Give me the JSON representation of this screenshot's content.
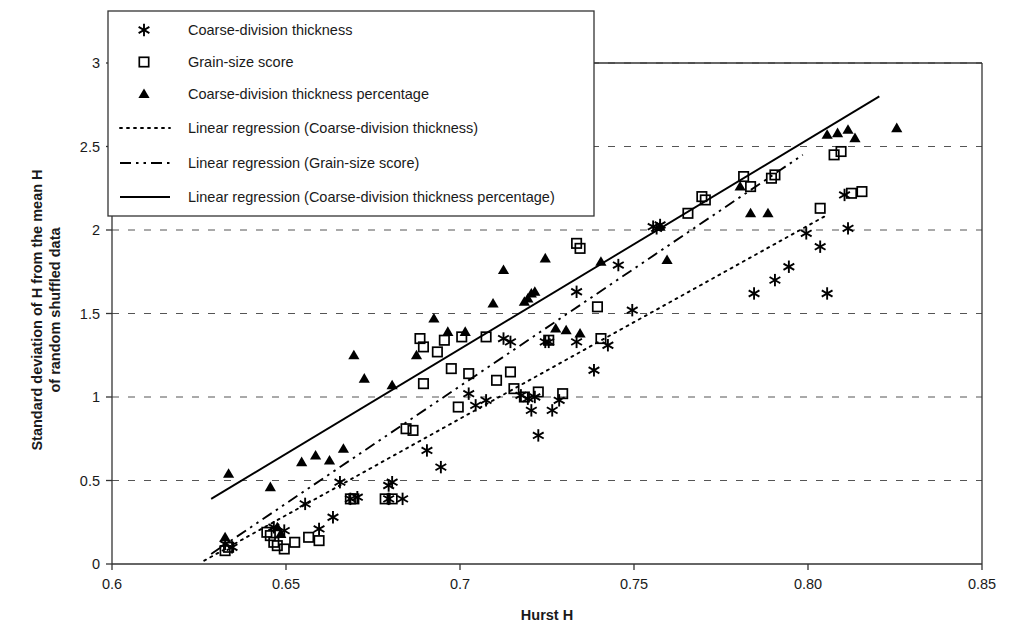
{
  "chart_data": {
    "type": "scatter",
    "title": "",
    "xlabel": "Hurst H",
    "ylabel_line1": "Standard deviation of H from the mean H",
    "ylabel_line2": "of random shuffled data",
    "xlim": [
      0.6,
      0.85
    ],
    "ylim": [
      0,
      3
    ],
    "xticks": [
      0.6,
      0.65,
      0.7,
      0.75,
      0.8,
      0.85
    ],
    "xtick_labels": [
      "0.6",
      "0.65",
      "0.7",
      "0.75",
      "0.80",
      "0.85"
    ],
    "yticks": [
      0,
      0.5,
      1,
      1.5,
      2,
      2.5,
      3
    ],
    "ytick_labels": [
      "0",
      "0.5",
      "1",
      "1.5",
      "2",
      "2.5",
      "3"
    ],
    "grid": "horizontal-dashed",
    "legend_position": "top-left-inside",
    "marker_color": "#000000",
    "series": [
      {
        "name": "Coarse-division thickness",
        "marker": "asterisk",
        "points": [
          [
            0.6325,
            0.12
          ],
          [
            0.6345,
            0.1
          ],
          [
            0.6465,
            0.22
          ],
          [
            0.6495,
            0.2
          ],
          [
            0.6555,
            0.36
          ],
          [
            0.6595,
            0.21
          ],
          [
            0.6635,
            0.28
          ],
          [
            0.6655,
            0.49
          ],
          [
            0.6685,
            0.39
          ],
          [
            0.6705,
            0.4
          ],
          [
            0.6795,
            0.47
          ],
          [
            0.6805,
            0.49
          ],
          [
            0.6795,
            0.39
          ],
          [
            0.6835,
            0.39
          ],
          [
            0.6905,
            0.68
          ],
          [
            0.6945,
            0.58
          ],
          [
            0.7025,
            1.02
          ],
          [
            0.7045,
            0.95
          ],
          [
            0.7075,
            0.98
          ],
          [
            0.7125,
            1.35
          ],
          [
            0.7145,
            1.33
          ],
          [
            0.7175,
            1.01
          ],
          [
            0.7195,
            0.99
          ],
          [
            0.7205,
            0.92
          ],
          [
            0.7215,
            1.0
          ],
          [
            0.7225,
            0.77
          ],
          [
            0.7245,
            1.33
          ],
          [
            0.7255,
            1.33
          ],
          [
            0.7265,
            0.92
          ],
          [
            0.7285,
            0.98
          ],
          [
            0.7335,
            1.63
          ],
          [
            0.7335,
            1.33
          ],
          [
            0.7385,
            1.16
          ],
          [
            0.7425,
            1.31
          ],
          [
            0.7455,
            1.79
          ],
          [
            0.7495,
            1.52
          ],
          [
            0.7555,
            2.02
          ],
          [
            0.7565,
            2.01
          ],
          [
            0.7575,
            2.03
          ],
          [
            0.7845,
            1.62
          ],
          [
            0.7905,
            1.7
          ],
          [
            0.7945,
            1.78
          ],
          [
            0.7995,
            1.98
          ],
          [
            0.8035,
            1.9
          ],
          [
            0.8055,
            1.62
          ],
          [
            0.8105,
            2.21
          ],
          [
            0.8115,
            2.01
          ]
        ]
      },
      {
        "name": "Grain-size score",
        "marker": "square",
        "points": [
          [
            0.6325,
            0.08
          ],
          [
            0.6335,
            0.1
          ],
          [
            0.6445,
            0.19
          ],
          [
            0.6455,
            0.17
          ],
          [
            0.6465,
            0.13
          ],
          [
            0.6475,
            0.11
          ],
          [
            0.6495,
            0.09
          ],
          [
            0.6525,
            0.13
          ],
          [
            0.6565,
            0.16
          ],
          [
            0.6595,
            0.14
          ],
          [
            0.6685,
            0.39
          ],
          [
            0.6695,
            0.39
          ],
          [
            0.6785,
            0.39
          ],
          [
            0.6805,
            0.39
          ],
          [
            0.6845,
            0.81
          ],
          [
            0.6865,
            0.8
          ],
          [
            0.6885,
            1.35
          ],
          [
            0.6895,
            1.3
          ],
          [
            0.6895,
            1.08
          ],
          [
            0.6935,
            1.27
          ],
          [
            0.6955,
            1.34
          ],
          [
            0.6975,
            1.17
          ],
          [
            0.6995,
            0.94
          ],
          [
            0.7005,
            1.36
          ],
          [
            0.7025,
            1.14
          ],
          [
            0.7075,
            1.36
          ],
          [
            0.7105,
            1.1
          ],
          [
            0.7145,
            1.15
          ],
          [
            0.7155,
            1.05
          ],
          [
            0.7185,
            1.0
          ],
          [
            0.7225,
            1.03
          ],
          [
            0.7255,
            1.34
          ],
          [
            0.7295,
            1.02
          ],
          [
            0.7335,
            1.92
          ],
          [
            0.7345,
            1.89
          ],
          [
            0.7395,
            1.54
          ],
          [
            0.7405,
            1.35
          ],
          [
            0.7655,
            2.1
          ],
          [
            0.7695,
            2.2
          ],
          [
            0.7705,
            2.18
          ],
          [
            0.7815,
            2.32
          ],
          [
            0.7835,
            2.26
          ],
          [
            0.7895,
            2.31
          ],
          [
            0.7905,
            2.33
          ],
          [
            0.8035,
            2.13
          ],
          [
            0.8075,
            2.45
          ],
          [
            0.8095,
            2.47
          ],
          [
            0.8125,
            2.22
          ],
          [
            0.8155,
            2.23
          ]
        ]
      },
      {
        "name": "Coarse-division thickness percentage",
        "marker": "triangle",
        "points": [
          [
            0.6325,
            0.16
          ],
          [
            0.6335,
            0.54
          ],
          [
            0.6455,
            0.46
          ],
          [
            0.6475,
            0.22
          ],
          [
            0.6485,
            0.18
          ],
          [
            0.6545,
            0.61
          ],
          [
            0.6585,
            0.65
          ],
          [
            0.6625,
            0.62
          ],
          [
            0.6665,
            0.69
          ],
          [
            0.6695,
            1.25
          ],
          [
            0.6725,
            1.11
          ],
          [
            0.6805,
            1.07
          ],
          [
            0.6875,
            1.25
          ],
          [
            0.6925,
            1.47
          ],
          [
            0.6965,
            1.39
          ],
          [
            0.7015,
            1.39
          ],
          [
            0.7095,
            1.56
          ],
          [
            0.7125,
            1.76
          ],
          [
            0.7185,
            1.57
          ],
          [
            0.7195,
            1.59
          ],
          [
            0.7205,
            1.62
          ],
          [
            0.7215,
            1.63
          ],
          [
            0.7245,
            1.83
          ],
          [
            0.7275,
            1.41
          ],
          [
            0.7305,
            1.4
          ],
          [
            0.7345,
            1.38
          ],
          [
            0.7405,
            1.81
          ],
          [
            0.7575,
            2.02
          ],
          [
            0.7595,
            1.82
          ],
          [
            0.7805,
            2.26
          ],
          [
            0.7835,
            2.1
          ],
          [
            0.7885,
            2.1
          ],
          [
            0.8055,
            2.57
          ],
          [
            0.8085,
            2.58
          ],
          [
            0.8115,
            2.6
          ],
          [
            0.8135,
            2.55
          ],
          [
            0.8255,
            2.61
          ]
        ]
      }
    ],
    "regressions": [
      {
        "name": "Linear regression (Coarse-division thickness)",
        "style": "dotted",
        "x0": 0.6265,
        "y0": 0.02,
        "x1": 0.8055,
        "y1": 2.09
      },
      {
        "name": "Linear regression (Grain-size score)",
        "style": "dash-dot",
        "x0": 0.6285,
        "y0": 0.06,
        "x1": 0.7985,
        "y1": 2.45
      },
      {
        "name": "Linear regression (Coarse-division thickness percentage)",
        "style": "solid",
        "x0": 0.6285,
        "y0": 0.39,
        "x1": 0.8205,
        "y1": 2.8
      }
    ]
  },
  "legend": {
    "items": [
      {
        "label": "Coarse-division thickness",
        "key": "asterisk"
      },
      {
        "label": "Grain-size score",
        "key": "square"
      },
      {
        "label": "Coarse-division thickness percentage",
        "key": "triangle"
      },
      {
        "label": "Linear regression (Coarse-division thickness)",
        "key": "dotted"
      },
      {
        "label": "Linear regression (Grain-size score)",
        "key": "dash-dot"
      },
      {
        "label": "Linear regression (Coarse-division thickness percentage)",
        "key": "solid"
      }
    ]
  }
}
